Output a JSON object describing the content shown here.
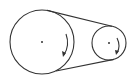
{
  "diagram": {
    "type": "belt-pulley",
    "stroke_color": "#333333",
    "background": "#ffffff",
    "pulleys": [
      {
        "name": "large-pulley",
        "cx": 42,
        "cy": 42,
        "r": 32,
        "rotation": "clockwise"
      },
      {
        "name": "small-pulley",
        "cx": 109,
        "cy": 43,
        "r": 17,
        "rotation": "clockwise"
      }
    ],
    "belt": {
      "segments": 2,
      "crossed": false
    }
  }
}
